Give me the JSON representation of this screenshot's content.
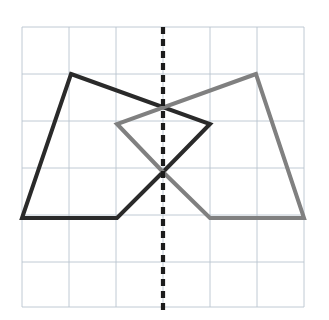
{
  "figure": {
    "canvas": {
      "width": 329,
      "height": 320,
      "background": "#ffffff"
    }
  },
  "grid": {
    "name": "square-grid",
    "color": "#b9c4cf",
    "stroke_width": 0.9,
    "x_min": 22,
    "y_min": 27,
    "x_max": 304,
    "y_max": 307,
    "cell_size": 47,
    "columns": 6,
    "rows": 6,
    "x_lines": [
      22,
      69,
      116,
      163,
      210,
      257,
      304
    ],
    "y_lines": [
      27,
      74,
      121,
      168,
      215,
      262,
      307
    ],
    "visible": true
  },
  "mirror_line": {
    "name": "line-of-symmetry",
    "orientation": "vertical",
    "x": 163,
    "y_start": 27,
    "y_end": 310,
    "color": "#1c1c1c",
    "stroke_width": 4.2,
    "dash": "7 5",
    "style": "dashed"
  },
  "shapes": [
    {
      "name": "original-pentagon",
      "side": "left",
      "color": "#2a2a2a",
      "stroke_width": 4.0,
      "closed": true,
      "vertices": [
        {
          "x": 71,
          "y": 74
        },
        {
          "x": 210,
          "y": 124
        },
        {
          "x": 163,
          "y": 172
        },
        {
          "x": 117,
          "y": 218
        },
        {
          "x": 22,
          "y": 218
        }
      ]
    },
    {
      "name": "reflected-pentagon",
      "side": "right",
      "color": "#808080",
      "stroke_width": 4.0,
      "closed": true,
      "vertices": [
        {
          "x": 256,
          "y": 74
        },
        {
          "x": 117,
          "y": 124
        },
        {
          "x": 163,
          "y": 172
        },
        {
          "x": 210,
          "y": 218
        },
        {
          "x": 304,
          "y": 218
        }
      ]
    }
  ],
  "intersection_points": [
    {
      "name": "upper-crossing",
      "x": 163,
      "y": 106
    },
    {
      "name": "lower-crossing",
      "x": 163,
      "y": 172
    }
  ],
  "chart_data": {
    "type": "scatter",
    "xlabel": "",
    "ylabel": "",
    "xlim": [
      22,
      304
    ],
    "ylim": [
      27,
      307
    ],
    "grid": true,
    "legend_position": "none",
    "series": [
      {
        "name": "original-pentagon",
        "color": "#2a2a2a",
        "x": [
          71,
          210,
          163,
          117,
          22,
          71
        ],
        "y": [
          74,
          124,
          172,
          218,
          218,
          74
        ]
      },
      {
        "name": "reflected-pentagon",
        "color": "#808080",
        "x": [
          256,
          117,
          163,
          210,
          304,
          256
        ],
        "y": [
          74,
          124,
          172,
          218,
          218,
          74
        ]
      },
      {
        "name": "line-of-symmetry",
        "color": "#1c1c1c",
        "x": [
          163,
          163
        ],
        "y": [
          27,
          310
        ]
      }
    ]
  }
}
